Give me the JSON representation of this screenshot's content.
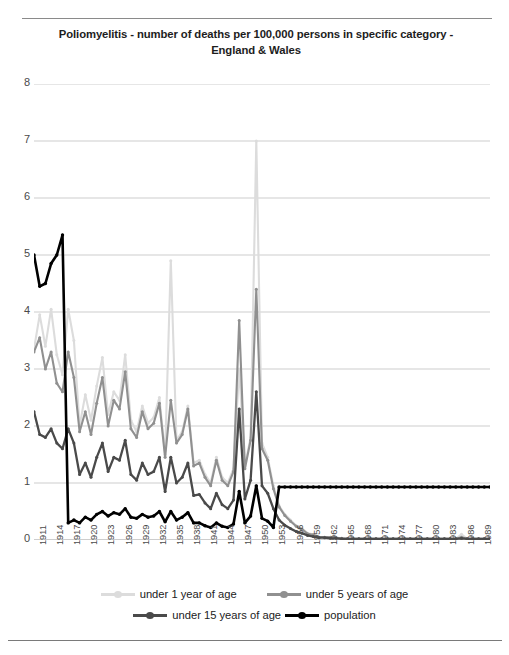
{
  "title": "Poliomyelitis - number of deaths per 100,000  persons in specific category - England & Wales",
  "legend": {
    "items": [
      {
        "label": "under 1 year of age",
        "color": "#DCDCDC"
      },
      {
        "label": "under 5 years of age",
        "color": "#909090"
      },
      {
        "label": "under 15 years of age",
        "color": "#4A4A4A"
      },
      {
        "label": "population",
        "color": "#000000"
      }
    ]
  },
  "chart_data": {
    "type": "line",
    "title": "Poliomyelitis - number of deaths per 100,000  persons in specific category - England & Wales",
    "xlabel": "",
    "ylabel": "",
    "ylim": [
      0,
      8
    ],
    "yticks": [
      0,
      1,
      2,
      3,
      4,
      5,
      6,
      7,
      8
    ],
    "grid": true,
    "legend_position": "bottom",
    "x": [
      1911,
      1912,
      1913,
      1914,
      1915,
      1916,
      1917,
      1918,
      1919,
      1920,
      1921,
      1922,
      1923,
      1924,
      1925,
      1926,
      1927,
      1928,
      1929,
      1930,
      1931,
      1932,
      1933,
      1934,
      1935,
      1936,
      1937,
      1938,
      1939,
      1940,
      1941,
      1942,
      1943,
      1944,
      1945,
      1946,
      1947,
      1948,
      1949,
      1950,
      1951,
      1952,
      1953,
      1954,
      1955,
      1956,
      1957,
      1958,
      1959,
      1960,
      1961,
      1962,
      1963,
      1964,
      1965,
      1966,
      1967,
      1968,
      1969,
      1970,
      1971,
      1972,
      1973,
      1974,
      1975,
      1976,
      1977,
      1978,
      1979,
      1980,
      1981,
      1982,
      1983,
      1984,
      1985,
      1986,
      1987,
      1988,
      1989,
      1990,
      1991
    ],
    "xtick_labels": [
      1911,
      1914,
      1917,
      1920,
      1923,
      1926,
      1929,
      1932,
      1935,
      1938,
      1941,
      1944,
      1947,
      1950,
      1953,
      1956,
      1959,
      1962,
      1965,
      1968,
      1971,
      1974,
      1977,
      1980,
      1983,
      1986,
      1989
    ],
    "series": [
      {
        "name": "under 1 year of age",
        "color": "#DCDCDC",
        "values": [
          3.35,
          3.95,
          3.4,
          4.05,
          3.25,
          2.9,
          4.05,
          3.5,
          2.0,
          2.55,
          2.1,
          2.7,
          3.2,
          2.2,
          2.6,
          2.45,
          3.25,
          2.1,
          1.9,
          2.35,
          2.05,
          2.15,
          2.5,
          1.5,
          4.9,
          1.75,
          1.9,
          2.35,
          1.35,
          1.4,
          1.15,
          1.0,
          1.45,
          1.1,
          1.0,
          1.25,
          3.0,
          1.3,
          1.8,
          7.0,
          1.7,
          1.45,
          0.95,
          0.6,
          0.45,
          0.35,
          0.25,
          0.2,
          0.12,
          0.1,
          0.05,
          0.05,
          0.05,
          0.04,
          0.03,
          0.02,
          0.02,
          0.02,
          0.02,
          0.02,
          0.02,
          0.02,
          0.02,
          0.02,
          0.02,
          0.02,
          0.02,
          0.02,
          0.02,
          0.02,
          0.02,
          0.02,
          0.02,
          0.02,
          0.02,
          0.1,
          0.02,
          0.02,
          0.02,
          0.02,
          0.02
        ]
      },
      {
        "name": "under 5 years of age",
        "color": "#909090",
        "values": [
          3.3,
          3.55,
          3.0,
          3.3,
          2.75,
          2.6,
          3.3,
          2.85,
          1.9,
          2.25,
          1.85,
          2.4,
          2.85,
          2.0,
          2.45,
          2.3,
          2.95,
          1.95,
          1.8,
          2.25,
          1.95,
          2.05,
          2.4,
          1.45,
          2.45,
          1.7,
          1.85,
          2.3,
          1.3,
          1.35,
          1.1,
          0.95,
          1.4,
          1.05,
          0.95,
          1.2,
          3.85,
          1.25,
          1.75,
          4.4,
          1.6,
          1.4,
          0.9,
          0.58,
          0.43,
          0.33,
          0.24,
          0.19,
          0.11,
          0.09,
          0.05,
          0.05,
          0.05,
          0.04,
          0.03,
          0.02,
          0.02,
          0.02,
          0.02,
          0.02,
          0.02,
          0.02,
          0.02,
          0.02,
          0.02,
          0.02,
          0.02,
          0.02,
          0.02,
          0.02,
          0.02,
          0.02,
          0.02,
          0.02,
          0.02,
          0.05,
          0.02,
          0.02,
          0.02,
          0.02,
          0.02
        ]
      },
      {
        "name": "under 15 years of age",
        "color": "#4A4A4A",
        "values": [
          2.25,
          1.85,
          1.8,
          1.95,
          1.7,
          1.6,
          1.95,
          1.7,
          1.15,
          1.35,
          1.1,
          1.45,
          1.7,
          1.2,
          1.45,
          1.4,
          1.75,
          1.15,
          1.05,
          1.35,
          1.15,
          1.2,
          1.45,
          0.85,
          1.45,
          1.0,
          1.1,
          1.35,
          0.78,
          0.8,
          0.65,
          0.55,
          0.82,
          0.62,
          0.55,
          0.7,
          2.3,
          0.72,
          1.05,
          2.6,
          0.95,
          0.82,
          0.55,
          0.35,
          0.26,
          0.2,
          0.15,
          0.12,
          0.08,
          0.06,
          0.04,
          0.04,
          0.03,
          0.03,
          0.02,
          0.02,
          0.02,
          0.02,
          0.02,
          0.02,
          0.02,
          0.02,
          0.02,
          0.02,
          0.02,
          0.02,
          0.02,
          0.02,
          0.02,
          0.02,
          0.02,
          0.02,
          0.02,
          0.02,
          0.02,
          0.03,
          0.02,
          0.02,
          0.02,
          0.02,
          0.02
        ]
      },
      {
        "name": "population",
        "color": "#000000",
        "values": [
          5.0,
          4.45,
          4.5,
          4.85,
          5.0,
          5.35,
          0.3,
          0.35,
          0.3,
          0.4,
          0.35,
          0.45,
          0.5,
          0.42,
          0.48,
          0.45,
          0.55,
          0.4,
          0.38,
          0.45,
          0.4,
          0.42,
          0.5,
          0.32,
          0.5,
          0.35,
          0.4,
          0.48,
          0.3,
          0.3,
          0.25,
          0.22,
          0.3,
          0.24,
          0.22,
          0.28,
          0.85,
          0.3,
          0.42,
          0.95,
          0.38,
          0.33,
          0.22,
          0.93,
          0.93,
          0.93,
          0.93,
          0.93,
          0.93,
          0.93,
          0.93,
          0.93,
          0.93,
          0.93,
          0.93,
          0.93,
          0.93,
          0.93,
          0.93,
          0.93,
          0.93,
          0.93,
          0.93,
          0.93,
          0.93,
          0.93,
          0.93,
          0.93,
          0.93,
          0.93,
          0.93,
          0.93,
          0.93,
          0.93,
          0.93,
          0.93,
          0.93,
          0.93,
          0.93,
          0.93,
          0.93
        ]
      }
    ]
  }
}
